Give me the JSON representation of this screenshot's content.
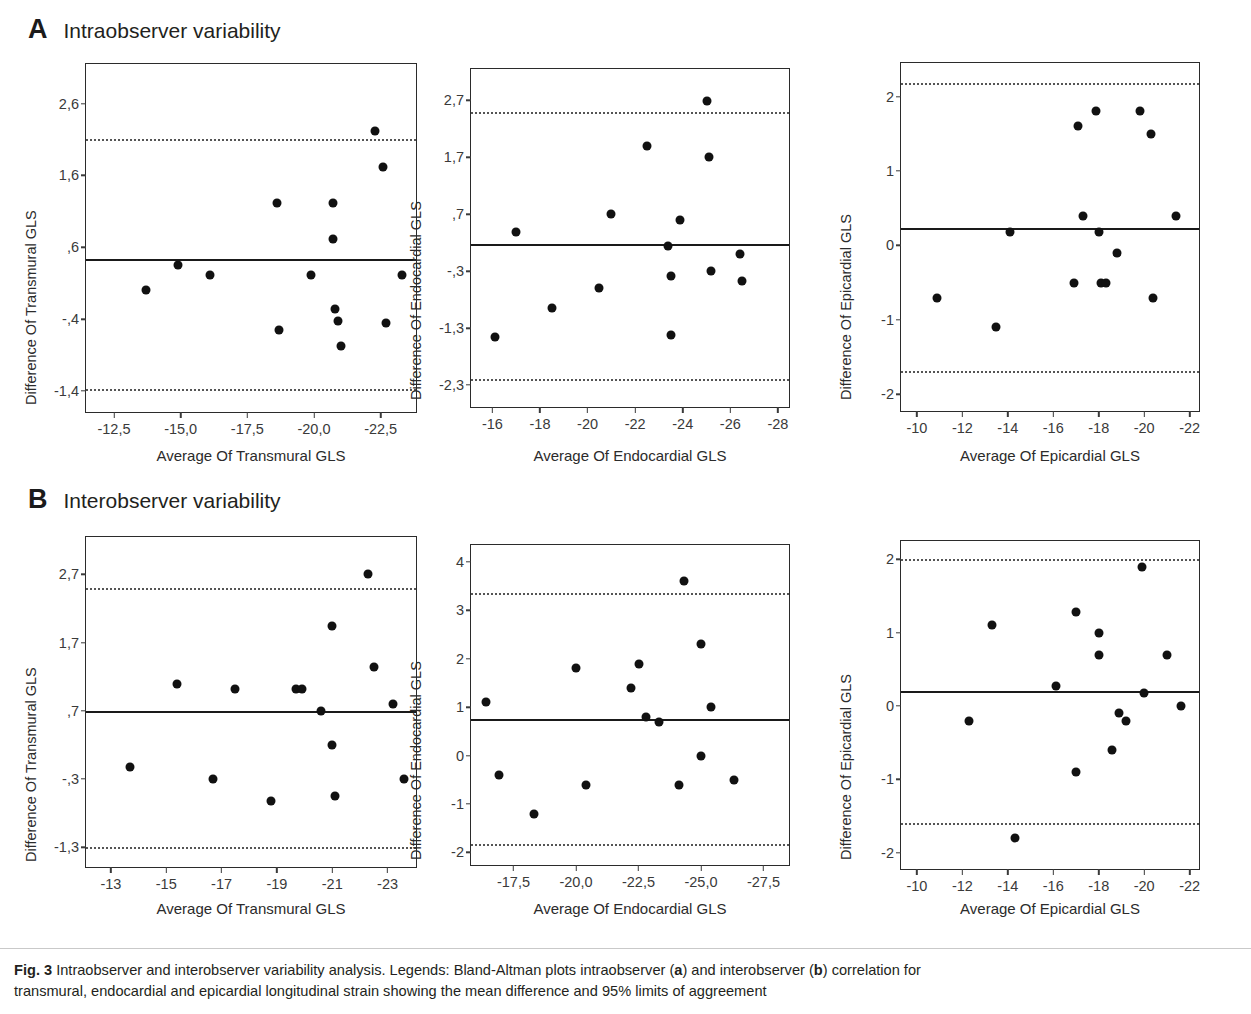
{
  "figure": {
    "caption_label": "Fig. 3",
    "caption_text_1": " Intraobserver and interobserver variability analysis. Legends: Bland-Altman plots intraobserver (",
    "caption_bold_a": "a",
    "caption_text_2": ") and interobserver (",
    "caption_bold_b": "b",
    "caption_text_3": ") correlation for",
    "caption_line2": "transmural, endocardial and epicardial longitudinal strain showing the mean difference and 95% limits of aggreement"
  },
  "groups": [
    {
      "letter": "A",
      "title": "Intraobserver variability"
    },
    {
      "letter": "B",
      "title": "Interobserver variability"
    }
  ],
  "chart_data": [
    {
      "id": "a-transmural",
      "type": "scatter",
      "title": "Intraobserver variability — Transmural GLS",
      "xlabel": "Average Of Transmural GLS",
      "ylabel": "Difference Of Transmural GLS",
      "xlim": [
        -11.45,
        -23.9
      ],
      "ylim": [
        -1.72,
        3.15
      ],
      "xticks": [
        -12.5,
        -15.0,
        -17.5,
        -20.0,
        -22.5
      ],
      "xticklabels": [
        "-12,5",
        "-15,0",
        "-17,5",
        "-20,0",
        "-22,5"
      ],
      "yticks": [
        2.6,
        1.6,
        0.6,
        -0.4,
        -1.4
      ],
      "yticklabels": [
        "2,6",
        "1,6",
        ",6",
        "-,4",
        "-1,4"
      ],
      "mean": 0.43,
      "loa_upper": 2.1,
      "loa_lower": -1.37,
      "grid": false,
      "legend": "none",
      "points": [
        {
          "x": -13.7,
          "y": 0.0
        },
        {
          "x": -14.9,
          "y": 0.35
        },
        {
          "x": -16.1,
          "y": 0.22
        },
        {
          "x": -18.6,
          "y": 1.22
        },
        {
          "x": -18.7,
          "y": -0.55
        },
        {
          "x": -19.9,
          "y": 0.22
        },
        {
          "x": -20.7,
          "y": 1.22
        },
        {
          "x": -20.7,
          "y": 0.72
        },
        {
          "x": -20.8,
          "y": -0.26
        },
        {
          "x": -20.9,
          "y": -0.42
        },
        {
          "x": -21.0,
          "y": -0.78
        },
        {
          "x": -22.3,
          "y": 2.22
        },
        {
          "x": -22.6,
          "y": 1.72
        },
        {
          "x": -22.7,
          "y": -0.46
        },
        {
          "x": -23.3,
          "y": 0.22
        }
      ]
    },
    {
      "id": "a-endocardial",
      "type": "scatter",
      "title": "Intraobserver variability — Endocardial GLS",
      "xlabel": "Average Of Endocardial GLS",
      "ylabel": "Difference Of Endocardial GLS",
      "xlim": [
        -15.1,
        -28.55
      ],
      "ylim": [
        -2.72,
        3.25
      ],
      "xticks": [
        -16,
        -18,
        -20,
        -22,
        -24,
        -26,
        -28
      ],
      "xticklabels": [
        "-16",
        "-18",
        "-20",
        "-22",
        "-24",
        "-26",
        "-28"
      ],
      "yticks": [
        2.7,
        1.7,
        0.7,
        -0.3,
        -1.3,
        -2.3
      ],
      "yticklabels": [
        "2,7",
        "1,7",
        ",7",
        "-,3",
        "-1,3",
        "-2,3"
      ],
      "mean": 0.18,
      "loa_upper": 2.5,
      "loa_lower": -2.2,
      "grid": false,
      "legend": "none",
      "points": [
        {
          "x": -16.1,
          "y": -1.45
        },
        {
          "x": -17.0,
          "y": 0.38
        },
        {
          "x": -18.5,
          "y": -0.95
        },
        {
          "x": -20.5,
          "y": -0.6
        },
        {
          "x": -21.0,
          "y": 0.7
        },
        {
          "x": -22.5,
          "y": 1.9
        },
        {
          "x": -23.4,
          "y": 0.15
        },
        {
          "x": -23.5,
          "y": -0.38
        },
        {
          "x": -23.5,
          "y": -1.42
        },
        {
          "x": -23.9,
          "y": 0.6
        },
        {
          "x": -25.0,
          "y": 2.68
        },
        {
          "x": -25.1,
          "y": 1.7
        },
        {
          "x": -25.2,
          "y": -0.3
        },
        {
          "x": -26.4,
          "y": 0.0
        },
        {
          "x": -26.5,
          "y": -0.48
        }
      ]
    },
    {
      "id": "a-epicardial",
      "type": "scatter",
      "title": "Intraobserver variability — Epicardial GLS",
      "xlabel": "Average Of Epicardial GLS",
      "ylabel": "Difference Of Epicardial GLS",
      "xlim": [
        -9.3,
        -22.5
      ],
      "ylim": [
        -2.25,
        2.45
      ],
      "xticks": [
        -10,
        -12,
        -14,
        -16,
        -18,
        -20,
        -22
      ],
      "xticklabels": [
        "-10",
        "-12",
        "-14",
        "-16",
        "-18",
        "-20",
        "-22"
      ],
      "yticks": [
        2,
        1,
        0,
        -1,
        -2
      ],
      "yticklabels": [
        "2",
        "1",
        "0",
        "-1",
        "-2"
      ],
      "mean": 0.23,
      "loa_upper": 2.18,
      "loa_lower": -1.68,
      "grid": false,
      "legend": "none",
      "points": [
        {
          "x": -10.9,
          "y": -0.7
        },
        {
          "x": -13.5,
          "y": -1.1
        },
        {
          "x": -14.1,
          "y": 0.18
        },
        {
          "x": -16.9,
          "y": -0.5
        },
        {
          "x": -17.1,
          "y": 1.6
        },
        {
          "x": -17.3,
          "y": 0.4
        },
        {
          "x": -17.9,
          "y": 1.8
        },
        {
          "x": -18.0,
          "y": 0.18
        },
        {
          "x": -18.1,
          "y": -0.5
        },
        {
          "x": -18.3,
          "y": -0.5
        },
        {
          "x": -18.8,
          "y": -0.1
        },
        {
          "x": -19.8,
          "y": 1.8
        },
        {
          "x": -20.3,
          "y": 1.5
        },
        {
          "x": -20.4,
          "y": -0.7
        },
        {
          "x": -21.4,
          "y": 0.4
        }
      ]
    },
    {
      "id": "b-transmural",
      "type": "scatter",
      "title": "Interobserver variability — Transmural GLS",
      "xlabel": "Average Of Transmural GLS",
      "ylabel": "Difference Of Transmural GLS",
      "xlim": [
        -12.1,
        -24.1
      ],
      "ylim": [
        -1.62,
        3.25
      ],
      "xticks": [
        -13,
        -15,
        -17,
        -19,
        -21,
        -23
      ],
      "xticklabels": [
        "-13",
        "-15",
        "-17",
        "-19",
        "-21",
        "-23"
      ],
      "yticks": [
        2.7,
        1.7,
        0.7,
        -0.3,
        -1.3
      ],
      "yticklabels": [
        "2,7",
        "1,7",
        ",7",
        "-,3",
        "-1,3"
      ],
      "mean": 0.7,
      "loa_upper": 2.5,
      "loa_lower": -1.3,
      "grid": false,
      "legend": "none",
      "points": [
        {
          "x": -13.7,
          "y": -0.12
        },
        {
          "x": -15.4,
          "y": 1.1
        },
        {
          "x": -16.7,
          "y": -0.3
        },
        {
          "x": -17.5,
          "y": 1.02
        },
        {
          "x": -18.8,
          "y": -0.62
        },
        {
          "x": -19.7,
          "y": 1.02
        },
        {
          "x": -19.9,
          "y": 1.02
        },
        {
          "x": -20.6,
          "y": 0.7
        },
        {
          "x": -21.0,
          "y": 0.2
        },
        {
          "x": -21.0,
          "y": 1.95
        },
        {
          "x": -21.1,
          "y": -0.55
        },
        {
          "x": -22.3,
          "y": 2.7
        },
        {
          "x": -22.5,
          "y": 1.35
        },
        {
          "x": -23.2,
          "y": 0.8
        },
        {
          "x": -23.6,
          "y": -0.3
        }
      ]
    },
    {
      "id": "b-endocardial",
      "type": "scatter",
      "title": "Interobserver variability — Endocardial GLS",
      "xlabel": "Average Of Endocardial GLS",
      "ylabel": "Difference Of Endocardial GLS",
      "xlim": [
        -15.8,
        -28.6
      ],
      "ylim": [
        -2.3,
        4.35
      ],
      "xticks": [
        -17.5,
        -20.0,
        -22.5,
        -25.0,
        -27.5
      ],
      "xticklabels": [
        "-17,5",
        "-20,0",
        "-22,5",
        "-25,0",
        "-27,5"
      ],
      "yticks": [
        4,
        3,
        2,
        1,
        0,
        -1,
        -2
      ],
      "yticklabels": [
        "4",
        "3",
        "2",
        "1",
        "0",
        "-1",
        "-2"
      ],
      "mean": 0.75,
      "loa_upper": 3.35,
      "loa_lower": -1.82,
      "grid": false,
      "legend": "none",
      "points": [
        {
          "x": -16.4,
          "y": 1.1
        },
        {
          "x": -16.9,
          "y": -0.4
        },
        {
          "x": -18.3,
          "y": -1.2
        },
        {
          "x": -20.0,
          "y": 1.8
        },
        {
          "x": -20.4,
          "y": -0.6
        },
        {
          "x": -22.2,
          "y": 1.4
        },
        {
          "x": -22.5,
          "y": 1.9
        },
        {
          "x": -22.8,
          "y": 0.8
        },
        {
          "x": -23.3,
          "y": 0.7
        },
        {
          "x": -24.1,
          "y": -0.6
        },
        {
          "x": -24.3,
          "y": 3.6
        },
        {
          "x": -25.0,
          "y": 2.3
        },
        {
          "x": -25.0,
          "y": 0.0
        },
        {
          "x": -25.4,
          "y": 1.0
        },
        {
          "x": -26.3,
          "y": -0.5
        }
      ]
    },
    {
      "id": "b-epicardial",
      "type": "scatter",
      "title": "Interobserver variability — Epicardial GLS",
      "xlabel": "Average Of Epicardial GLS",
      "ylabel": "Difference Of Epicardial GLS",
      "xlim": [
        -9.3,
        -22.5
      ],
      "ylim": [
        -2.25,
        2.25
      ],
      "xticks": [
        -10,
        -12,
        -14,
        -16,
        -18,
        -20,
        -22
      ],
      "xticklabels": [
        "-10",
        "-12",
        "-14",
        "-16",
        "-18",
        "-20",
        "-22"
      ],
      "yticks": [
        2,
        1,
        0,
        -1,
        -2
      ],
      "yticklabels": [
        "2",
        "1",
        "0",
        "-1",
        "-2"
      ],
      "mean": 0.2,
      "loa_upper": 2.0,
      "loa_lower": -1.6,
      "grid": false,
      "legend": "none",
      "points": [
        {
          "x": -12.3,
          "y": -0.2
        },
        {
          "x": -13.3,
          "y": 1.1
        },
        {
          "x": -14.3,
          "y": -1.8
        },
        {
          "x": -16.1,
          "y": 0.27
        },
        {
          "x": -17.0,
          "y": 1.28
        },
        {
          "x": -17.0,
          "y": -0.9
        },
        {
          "x": -18.0,
          "y": 1.0
        },
        {
          "x": -18.0,
          "y": 0.7
        },
        {
          "x": -18.6,
          "y": -0.6
        },
        {
          "x": -18.9,
          "y": -0.1
        },
        {
          "x": -19.2,
          "y": -0.2
        },
        {
          "x": -19.9,
          "y": 1.9
        },
        {
          "x": -20.0,
          "y": 0.18
        },
        {
          "x": -21.0,
          "y": 0.7
        },
        {
          "x": -21.6,
          "y": 0.0
        }
      ]
    }
  ]
}
